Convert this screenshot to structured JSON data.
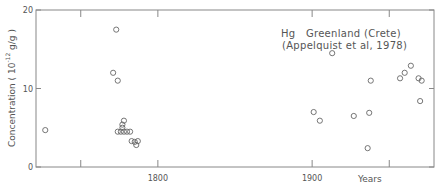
{
  "chart_data": {
    "type": "scatter",
    "title": "",
    "annotation": {
      "line1": "Hg   Greenland (Crete)",
      "line2": "(Appelquist et al, 1978)"
    },
    "xlabel": "Years",
    "ylabel": "Concentration ( 10",
    "ylabel_exp": "-12",
    "ylabel_unit": " g/g )",
    "xlim": [
      1721,
      1979
    ],
    "ylim": [
      0,
      20
    ],
    "x_ticks": [
      1750,
      1800,
      1900,
      1950
    ],
    "x_tick_labels": [
      {
        "value": 1800,
        "label": "1800"
      },
      {
        "value": 1900,
        "label": "1900"
      }
    ],
    "y_ticks": [
      {
        "value": 0,
        "label": "0"
      },
      {
        "value": 10,
        "label": "10"
      },
      {
        "value": 20,
        "label": "20"
      }
    ],
    "grid": false,
    "marker": "open-circle",
    "series": [
      {
        "name": "Hg Greenland (Crete)",
        "points": [
          {
            "x": 1727,
            "y": 4.7
          },
          {
            "x": 1773,
            "y": 17.5
          },
          {
            "x": 1771,
            "y": 12.0
          },
          {
            "x": 1774,
            "y": 11.0
          },
          {
            "x": 1778,
            "y": 5.9
          },
          {
            "x": 1777,
            "y": 5.4
          },
          {
            "x": 1777,
            "y": 5.0
          },
          {
            "x": 1774,
            "y": 4.5
          },
          {
            "x": 1776,
            "y": 4.5
          },
          {
            "x": 1778,
            "y": 4.5
          },
          {
            "x": 1780,
            "y": 4.5
          },
          {
            "x": 1782,
            "y": 4.5
          },
          {
            "x": 1783,
            "y": 3.3
          },
          {
            "x": 1785,
            "y": 3.2
          },
          {
            "x": 1786,
            "y": 2.8
          },
          {
            "x": 1787,
            "y": 3.3
          },
          {
            "x": 1901,
            "y": 7.0
          },
          {
            "x": 1905,
            "y": 5.9
          },
          {
            "x": 1913,
            "y": 14.5
          },
          {
            "x": 1927,
            "y": 6.5
          },
          {
            "x": 1937,
            "y": 6.9
          },
          {
            "x": 1936,
            "y": 2.4
          },
          {
            "x": 1938,
            "y": 11.0
          },
          {
            "x": 1957,
            "y": 11.3
          },
          {
            "x": 1960,
            "y": 12.0
          },
          {
            "x": 1964,
            "y": 12.9
          },
          {
            "x": 1969,
            "y": 11.3
          },
          {
            "x": 1971,
            "y": 11.0
          },
          {
            "x": 1970,
            "y": 8.4
          }
        ]
      }
    ]
  }
}
